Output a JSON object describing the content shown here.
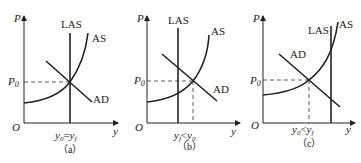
{
  "figure": {
    "panels": [
      {
        "id": "a",
        "caption": "（a）",
        "axis_y_label": "P",
        "axis_x_label": "y",
        "origin_label": "O",
        "price_label": "P0",
        "curves": [
          "LAS",
          "AS",
          "AD"
        ],
        "x_tick_label": "y0=yf",
        "description": "AD and AS intersect on LAS"
      },
      {
        "id": "b",
        "caption": "（b）",
        "axis_y_label": "P",
        "axis_x_label": "y",
        "origin_label": "O",
        "price_label": "P0",
        "curves": [
          "LAS",
          "AS",
          "AD"
        ],
        "x_tick_label": "yf<y0",
        "description": "AD and AS intersect to the right of LAS"
      },
      {
        "id": "c",
        "caption": "（c）",
        "axis_y_label": "P",
        "axis_x_label": "y",
        "origin_label": "O",
        "price_label": "P0",
        "curves": [
          "LAS",
          "AS",
          "AD"
        ],
        "x_tick_label": "y0<yf",
        "description": "AD and AS intersect to the left of LAS"
      }
    ]
  },
  "labels": {
    "P": "P",
    "y": "y",
    "O": "O",
    "P0_main": "P",
    "P0_sub": "0",
    "LAS": "LAS",
    "AS": "AS",
    "AD": "AD",
    "cap_a": "（a）",
    "cap_b": "（b）",
    "cap_c": "（c）",
    "tick_a_main": "y",
    "tick_a_sub1": "0",
    "tick_a_eq": "=",
    "tick_a_main2": "y",
    "tick_a_sub2": "f",
    "tick_b_main": "y",
    "tick_b_sub1": "f",
    "tick_b_op": "<",
    "tick_b_main2": "y",
    "tick_b_sub2": "0",
    "tick_c_main": "y",
    "tick_c_sub1": "0",
    "tick_c_op": "<",
    "tick_c_main2": "y",
    "tick_c_sub2": "f"
  }
}
